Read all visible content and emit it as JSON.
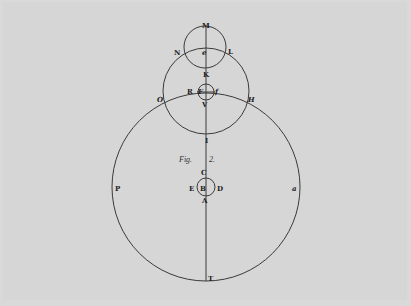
{
  "figure": {
    "caption": "Fig. 2.",
    "caption_parts": [
      "Fig.",
      "2."
    ],
    "colors": {
      "paper": "#d6d6d6",
      "ink": "#3a3a3a",
      "text": "#222222"
    }
  },
  "geometry": {
    "axis": {
      "x": 206,
      "y_top": 26,
      "y_bottom": 281
    },
    "circles": [
      {
        "id": "outer-orbit",
        "cx": 206,
        "cy": 187,
        "r": 94
      },
      {
        "id": "middle-circle",
        "cx": 206,
        "cy": 91,
        "r": 43
      },
      {
        "id": "top-circle",
        "cx": 205,
        "cy": 47,
        "r": 21
      },
      {
        "id": "small-circle-F",
        "cx": 206,
        "cy": 92,
        "r": 8
      },
      {
        "id": "small-circle-B",
        "cx": 206,
        "cy": 187,
        "r": 9
      }
    ],
    "chord_RF": {
      "x1": 197,
      "y1": 92,
      "x2": 215,
      "y2": 92
    }
  },
  "labels": {
    "M": "M",
    "N": "N",
    "e": "e",
    "L": "L",
    "K": "K",
    "R": "R",
    "F": "F",
    "f": "f",
    "O": "O",
    "H": "H",
    "V": "V",
    "I": "I",
    "C": "C",
    "E": "E",
    "B": "B",
    "D": "D",
    "A": "A",
    "P": "P",
    "a": "a",
    "T": "T"
  }
}
